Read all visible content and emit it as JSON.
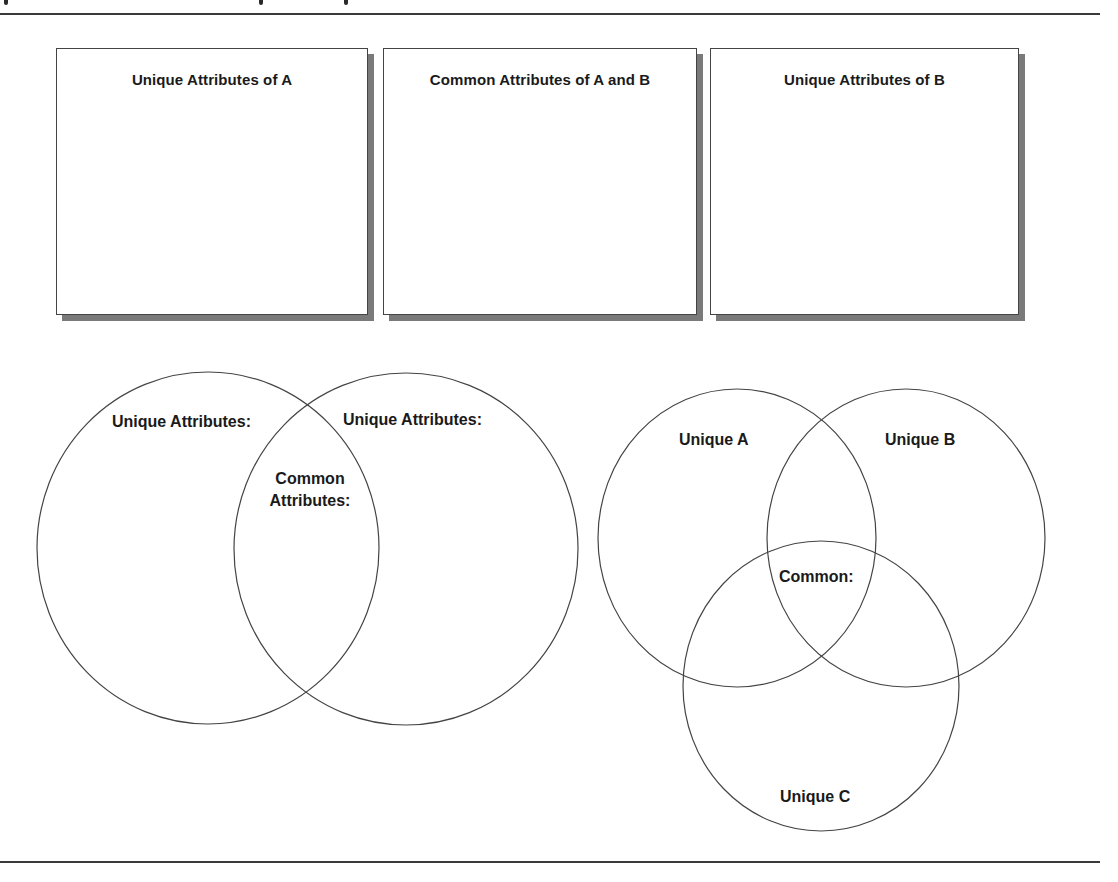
{
  "page": {
    "header_rule": true,
    "footer_rule": true,
    "caption_visible_text": ""
  },
  "attribute_boxes": [
    {
      "id": "box-a",
      "title": "Unique Attributes of A"
    },
    {
      "id": "box-ab",
      "title": "Common Attributes of A and B"
    },
    {
      "id": "box-b",
      "title": "Unique Attributes of B"
    }
  ],
  "venn_two": {
    "circles": [
      {
        "name": "left",
        "cx": 208,
        "cy": 548,
        "rx": 171,
        "ry": 176
      },
      {
        "name": "right",
        "cx": 406,
        "cy": 549,
        "rx": 172,
        "ry": 176
      }
    ],
    "labels": {
      "left": "Unique Attributes:",
      "right": "Unique Attributes:",
      "common_line1": "Common",
      "common_line2": "Attributes:"
    }
  },
  "venn_three": {
    "circles": [
      {
        "name": "A",
        "cx": 737,
        "cy": 538,
        "rx": 139,
        "ry": 149
      },
      {
        "name": "B",
        "cx": 906,
        "cy": 538,
        "rx": 139,
        "ry": 149
      },
      {
        "name": "C",
        "cx": 821,
        "cy": 686,
        "rx": 138,
        "ry": 145
      }
    ],
    "labels": {
      "a": "Unique A",
      "b": "Unique B",
      "c": "Unique C",
      "common": "Common:"
    }
  },
  "colors": {
    "stroke": "#444444",
    "shadow": "#7a7a7a",
    "rule": "#3a3a3a",
    "background": "#ffffff"
  }
}
